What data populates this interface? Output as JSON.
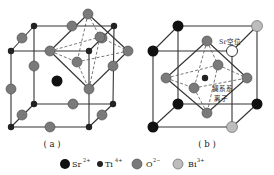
{
  "figure": {
    "panels": [
      {
        "id": "a",
        "caption": "( a )"
      },
      {
        "id": "b",
        "caption": "( b )"
      }
    ],
    "annotations": {
      "sr_vacancy": "Sr空位",
      "lanthanide_line1": "镧系系",
      "lanthanide_line2": "离子"
    },
    "legend": [
      {
        "symbol": "Sr",
        "charge": "2+",
        "color": "#111111",
        "size": "large"
      },
      {
        "symbol": "Ti",
        "charge": "4+",
        "color": "#222222",
        "size": "small"
      },
      {
        "symbol": "O",
        "charge": "2−",
        "color": "#7a7a7a",
        "size": "large"
      },
      {
        "symbol": "Bi",
        "charge": "3+",
        "color": "#bdbdbd",
        "size": "large"
      }
    ],
    "colors": {
      "sr": "#111111",
      "ti": "#222222",
      "o": "#7a7a7a",
      "bi": "#bdbdbd",
      "vacancy": "#ffffff"
    }
  }
}
